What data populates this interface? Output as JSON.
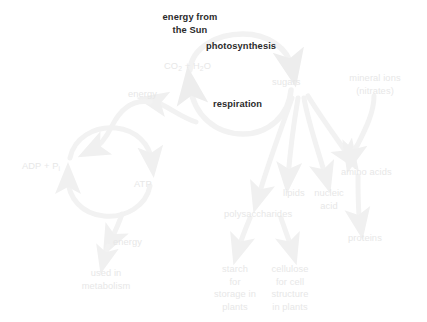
{
  "diagram": {
    "type": "flow-diagram",
    "colors": {
      "background": "#ffffff",
      "emphasis_text": "#2b2b2b",
      "faint_text": "#e7e7e7",
      "arrow": "#f2f2f2"
    },
    "nodes": [
      {
        "id": "energy-from-sun",
        "label": "energy from\nthe Sun",
        "emphasis": true,
        "x": 154,
        "y": 11,
        "align": "center"
      },
      {
        "id": "photosynthesis",
        "label": "photosynthesis",
        "emphasis": true,
        "x": 206,
        "y": 40,
        "align": "left"
      },
      {
        "id": "co2-h2o",
        "label": "CO2 + H2O",
        "emphasis": false,
        "x": 164,
        "y": 60,
        "align": "left"
      },
      {
        "id": "sugars",
        "label": "sugars",
        "emphasis": false,
        "x": 272,
        "y": 76,
        "align": "left"
      },
      {
        "id": "mineral-ions",
        "label": "mineral ions\n(nitrates)",
        "emphasis": false,
        "x": 374,
        "y": 76,
        "align": "center"
      },
      {
        "id": "energy-left",
        "label": "energy",
        "emphasis": false,
        "x": 128,
        "y": 88,
        "align": "left"
      },
      {
        "id": "respiration",
        "label": "respiration",
        "emphasis": true,
        "x": 213,
        "y": 98,
        "align": "left"
      },
      {
        "id": "adp-pi",
        "label": "ADP + Pi",
        "emphasis": false,
        "x": 22,
        "y": 160,
        "align": "left"
      },
      {
        "id": "amino-acids",
        "label": "amino acids",
        "emphasis": false,
        "x": 341,
        "y": 166,
        "align": "left"
      },
      {
        "id": "atp",
        "label": "ATP",
        "emphasis": false,
        "x": 134,
        "y": 178,
        "align": "left"
      },
      {
        "id": "lipids",
        "label": "lipids",
        "emphasis": false,
        "x": 283,
        "y": 187,
        "align": "left"
      },
      {
        "id": "nucleic-acid",
        "label": "nucleic\nacid",
        "emphasis": false,
        "x": 328,
        "y": 187,
        "align": "center"
      },
      {
        "id": "polysaccharides",
        "label": "polysaccharides",
        "emphasis": false,
        "x": 224,
        "y": 208,
        "align": "left"
      },
      {
        "id": "proteins",
        "label": "proteins",
        "emphasis": false,
        "x": 348,
        "y": 232,
        "align": "left"
      },
      {
        "id": "energy-bottom",
        "label": "energy",
        "emphasis": false,
        "x": 113,
        "y": 236,
        "align": "left"
      },
      {
        "id": "used-in-metabolism",
        "label": "used in\nmetabolism",
        "emphasis": false,
        "x": 106,
        "y": 267,
        "align": "center"
      },
      {
        "id": "starch",
        "label": "starch\nfor\nstorage in\nplants",
        "emphasis": false,
        "x": 235,
        "y": 263,
        "align": "center"
      },
      {
        "id": "cellulose",
        "label": "cellulose\nfor cell\nstructure\nin plants",
        "emphasis": false,
        "x": 289,
        "y": 263,
        "align": "center"
      }
    ],
    "edges": [
      {
        "id": "co2-to-sugars",
        "from": "co2-h2o",
        "to": "sugars",
        "via": "photosynthesis"
      },
      {
        "id": "sugars-to-co2",
        "from": "sugars",
        "to": "co2-h2o",
        "via": "respiration"
      },
      {
        "id": "respiration-to-energy",
        "from": "respiration",
        "to": "energy-left"
      },
      {
        "id": "adp-to-atp",
        "from": "adp-pi",
        "to": "atp"
      },
      {
        "id": "atp-to-adp",
        "from": "atp",
        "to": "adp-pi"
      },
      {
        "id": "atp-to-energy-bottom",
        "from": "atp",
        "to": "energy-bottom"
      },
      {
        "id": "energy-to-metabolism",
        "from": "energy-bottom",
        "to": "used-in-metabolism"
      },
      {
        "id": "sugars-to-polysaccharides",
        "from": "sugars",
        "to": "polysaccharides"
      },
      {
        "id": "sugars-to-lipids",
        "from": "sugars",
        "to": "lipids"
      },
      {
        "id": "sugars-to-nucleic-acid",
        "from": "sugars",
        "to": "nucleic-acid"
      },
      {
        "id": "sugars-to-amino-acids",
        "from": "sugars",
        "to": "amino-acids"
      },
      {
        "id": "minerals-to-amino-acids",
        "from": "mineral-ions",
        "to": "amino-acids"
      },
      {
        "id": "amino-acids-to-proteins",
        "from": "amino-acids",
        "to": "proteins"
      },
      {
        "id": "poly-to-starch",
        "from": "polysaccharides",
        "to": "starch"
      },
      {
        "id": "poly-to-cellulose",
        "from": "polysaccharides",
        "to": "cellulose"
      }
    ]
  }
}
